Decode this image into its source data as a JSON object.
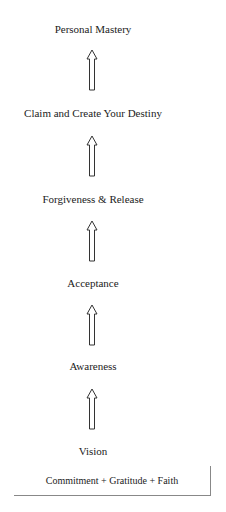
{
  "diagram": {
    "type": "vertical-progression",
    "direction": "bottom-to-top",
    "steps": [
      "Personal Mastery",
      "Claim and Create Your Destiny",
      "Forgiveness & Release",
      "Acceptance",
      "Awareness",
      "Vision"
    ],
    "foundation": "Commitment + Gratitude + Faith",
    "arrow_icon": "up-arrow-outline-icon"
  }
}
